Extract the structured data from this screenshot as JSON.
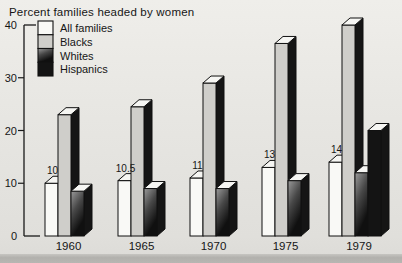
{
  "title": "Percent families headed by women",
  "colors": {
    "background": "#e7e6e2",
    "outline": "#111111",
    "axis": "#1a1a1a",
    "text": "#161616",
    "all_families": "#f9f9f6",
    "blacks": "#cfceca",
    "whites_gradient_start": "#9b9b9b",
    "whites_gradient_mid": "#484848",
    "whites_gradient_end": "#101010",
    "hispanics": "#141414",
    "side_face": "#151515",
    "top_face": "#f6f6f3"
  },
  "chart_data": {
    "type": "bar",
    "subtype": "3d-grouped-bars",
    "title": "Percent families headed by women",
    "categories": [
      "1960",
      "1965",
      "1970",
      "1975",
      "1979"
    ],
    "series": [
      {
        "name": "All families",
        "values": [
          10,
          10.5,
          11,
          13,
          14
        ]
      },
      {
        "name": "Blacks",
        "values": [
          23,
          24.5,
          29,
          36.5,
          40
        ]
      },
      {
        "name": "Whites",
        "values": [
          8.5,
          9,
          9,
          10.5,
          12
        ]
      },
      {
        "name": "Hispanics",
        "values": [
          null,
          null,
          null,
          null,
          20
        ]
      }
    ],
    "bar_value_labels": [
      "10",
      "10.5",
      "11",
      "13",
      "14"
    ],
    "ylabel": "",
    "xlabel": "",
    "ylim": [
      0,
      40
    ],
    "yticks": [
      0,
      10,
      20,
      30,
      40
    ],
    "grid": false,
    "legend_position": "top-left",
    "legend_entries": [
      "All families",
      "Blacks",
      "Whites",
      "Hispanics"
    ]
  }
}
